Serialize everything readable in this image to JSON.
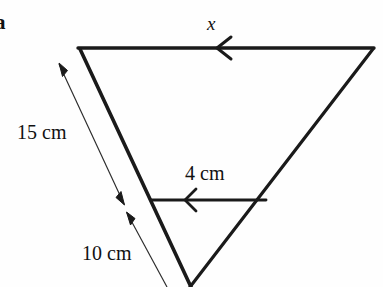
{
  "figure": {
    "part_letter": "a",
    "background_color": "#fefefe",
    "stroke_color": "#1a1a1a",
    "labels": {
      "unknown_side": "x",
      "left_side_full": "15 cm",
      "inner_parallel_line": "4 cm",
      "left_side_lower": "10 cm"
    },
    "shape": {
      "type": "triangle",
      "orientation": "inverted",
      "vertices": {
        "top_left": [
          80,
          48
        ],
        "top_right": [
          373,
          48
        ],
        "apex_bottom": [
          190,
          287
        ]
      },
      "inner_line": {
        "from": [
          152,
          200
        ],
        "to": [
          265,
          200
        ],
        "parallel_to": "top-side"
      }
    },
    "arrow_marks": {
      "top_side_direction": "left",
      "inner_line_direction": "left",
      "dimension_15cm": "double-headed",
      "dimension_10cm": "double-headed"
    },
    "measurements": [
      {
        "name": "x",
        "value": null,
        "unit": "cm",
        "side": "top",
        "known": false
      },
      {
        "name": "15 cm",
        "value": 15,
        "unit": "cm",
        "side": "left-full",
        "known": true
      },
      {
        "name": "4 cm",
        "value": 4,
        "unit": "cm",
        "side": "inner-parallel",
        "known": true
      },
      {
        "name": "10 cm",
        "value": 10,
        "unit": "cm",
        "side": "left-lower",
        "known": true
      }
    ]
  }
}
